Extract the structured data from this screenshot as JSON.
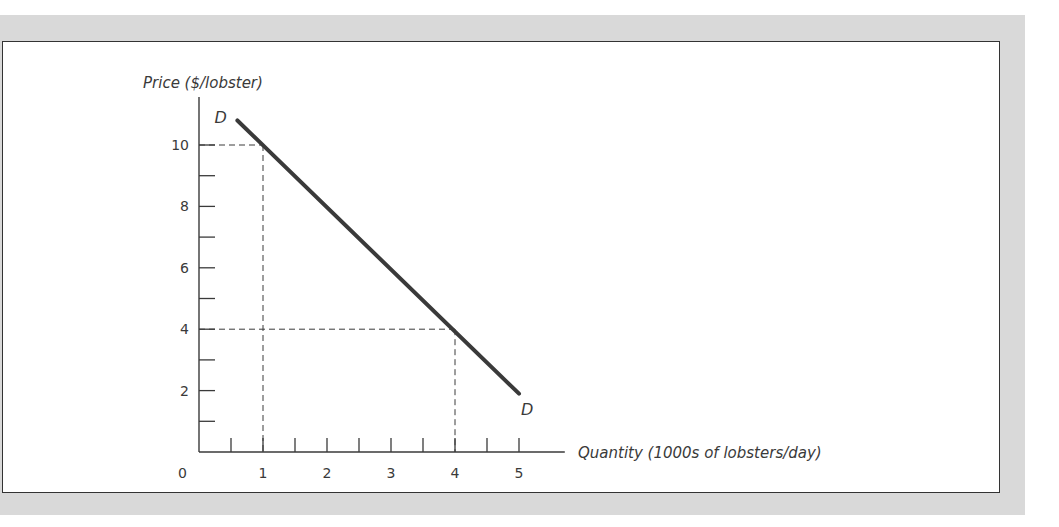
{
  "chart_data": {
    "type": "line",
    "title": "",
    "xlabel": "Quantity (1000s of lobsters/day)",
    "ylabel": "Price ($/lobster)",
    "origin_label": "0",
    "x_ticks": [
      1,
      2,
      3,
      4,
      5
    ],
    "x_tick_labels": [
      "1",
      "2",
      "3",
      "4",
      "5"
    ],
    "x_minor_step": 0.5,
    "y_ticks": [
      2,
      4,
      6,
      8,
      10
    ],
    "y_tick_labels": [
      "2",
      "4",
      "6",
      "8",
      "10"
    ],
    "y_minor_step": 1,
    "xlim": [
      0,
      5.7
    ],
    "ylim": [
      0,
      11.5
    ],
    "grid": false,
    "legend": null,
    "series": [
      {
        "name": "D",
        "label_start": "D",
        "label_end": "D",
        "color": "#3a3a3a",
        "x": [
          0.6,
          5.0
        ],
        "y": [
          10.8,
          1.9
        ]
      }
    ],
    "reference_points": [
      {
        "x": 1,
        "y": 10,
        "style": "dashed"
      },
      {
        "x": 4,
        "y": 4,
        "style": "dashed"
      }
    ]
  },
  "colors": {
    "background_band": "#d9d9d9",
    "frame_border": "#333333",
    "ink": "#3a3a3a"
  }
}
